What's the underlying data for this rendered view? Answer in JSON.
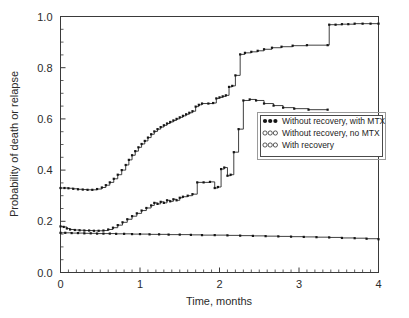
{
  "chart_data": {
    "type": "line",
    "title": "",
    "subtitle": "",
    "xlabel": "Time, months",
    "ylabel": "Probability of death or relapse",
    "xlim": [
      0,
      4
    ],
    "ylim": [
      0,
      1.0
    ],
    "grid": false,
    "legend_position": "center-right",
    "x_ticks": [
      "0",
      "1",
      "2",
      "3",
      "4"
    ],
    "x_tick_values": [
      0,
      1,
      2,
      3,
      4
    ],
    "x_minor_interval": 0.1,
    "y_ticks": [
      "0.0",
      "0.2",
      "0.4",
      "0.6",
      "0.8",
      "1.0"
    ],
    "y_tick_values": [
      0.0,
      0.2,
      0.4,
      0.6,
      0.8,
      1.0
    ],
    "y_minor_interval": 0.05,
    "marker_style": "step-curve-with-points",
    "line_color": "#2a2a2a",
    "marker_color": "#151515",
    "series": [
      {
        "name": "Without recovery, with MTX",
        "legend_marker": "filled",
        "points": [
          [
            0.0,
            0.33
          ],
          [
            0.05,
            0.33
          ],
          [
            0.1,
            0.329
          ],
          [
            0.16,
            0.327
          ],
          [
            0.22,
            0.325
          ],
          [
            0.28,
            0.324
          ],
          [
            0.34,
            0.323
          ],
          [
            0.4,
            0.323
          ],
          [
            0.46,
            0.326
          ],
          [
            0.52,
            0.332
          ],
          [
            0.57,
            0.341
          ],
          [
            0.62,
            0.352
          ],
          [
            0.67,
            0.366
          ],
          [
            0.72,
            0.382
          ],
          [
            0.77,
            0.4
          ],
          [
            0.82,
            0.42
          ],
          [
            0.86,
            0.44
          ],
          [
            0.9,
            0.458
          ],
          [
            0.94,
            0.474
          ],
          [
            0.98,
            0.489
          ],
          [
            1.02,
            0.502
          ],
          [
            1.06,
            0.514
          ],
          [
            1.1,
            0.527
          ],
          [
            1.14,
            0.54
          ],
          [
            1.18,
            0.551
          ],
          [
            1.22,
            0.56
          ],
          [
            1.26,
            0.568
          ],
          [
            1.3,
            0.575
          ],
          [
            1.34,
            0.582
          ],
          [
            1.38,
            0.588
          ],
          [
            1.42,
            0.594
          ],
          [
            1.46,
            0.6
          ],
          [
            1.5,
            0.606
          ],
          [
            1.54,
            0.612
          ],
          [
            1.58,
            0.618
          ],
          [
            1.62,
            0.624
          ],
          [
            1.66,
            0.63
          ],
          [
            1.7,
            0.648
          ],
          [
            1.74,
            0.655
          ],
          [
            1.78,
            0.66
          ],
          [
            1.86,
            0.66
          ],
          [
            1.92,
            0.662
          ],
          [
            1.96,
            0.68
          ],
          [
            2.0,
            0.684
          ],
          [
            2.04,
            0.688
          ],
          [
            2.08,
            0.692
          ],
          [
            2.12,
            0.725
          ],
          [
            2.16,
            0.729
          ],
          [
            2.2,
            0.77
          ],
          [
            2.26,
            0.852
          ],
          [
            2.32,
            0.858
          ],
          [
            2.4,
            0.862
          ],
          [
            2.48,
            0.866
          ],
          [
            2.56,
            0.872
          ],
          [
            2.66,
            0.878
          ],
          [
            2.78,
            0.882
          ],
          [
            2.92,
            0.886
          ],
          [
            3.1,
            0.888
          ],
          [
            3.36,
            0.888
          ],
          [
            3.38,
            0.968
          ],
          [
            3.46,
            0.968
          ],
          [
            3.54,
            0.97
          ],
          [
            3.62,
            0.97
          ],
          [
            3.7,
            0.972
          ],
          [
            3.8,
            0.972
          ],
          [
            3.9,
            0.972
          ],
          [
            4.0,
            0.972
          ]
        ]
      },
      {
        "name": "Without recovery, no MTX",
        "legend_marker": "open",
        "points": [
          [
            0.0,
            0.18
          ],
          [
            0.04,
            0.178
          ],
          [
            0.08,
            0.172
          ],
          [
            0.12,
            0.168
          ],
          [
            0.18,
            0.166
          ],
          [
            0.24,
            0.165
          ],
          [
            0.3,
            0.164
          ],
          [
            0.36,
            0.164
          ],
          [
            0.42,
            0.163
          ],
          [
            0.48,
            0.163
          ],
          [
            0.54,
            0.164
          ],
          [
            0.6,
            0.168
          ],
          [
            0.66,
            0.175
          ],
          [
            0.72,
            0.185
          ],
          [
            0.78,
            0.196
          ],
          [
            0.84,
            0.208
          ],
          [
            0.9,
            0.22
          ],
          [
            0.96,
            0.231
          ],
          [
            1.02,
            0.242
          ],
          [
            1.08,
            0.252
          ],
          [
            1.14,
            0.262
          ],
          [
            1.18,
            0.272
          ],
          [
            1.22,
            0.268
          ],
          [
            1.26,
            0.276
          ],
          [
            1.3,
            0.272
          ],
          [
            1.34,
            0.282
          ],
          [
            1.38,
            0.278
          ],
          [
            1.42,
            0.286
          ],
          [
            1.46,
            0.282
          ],
          [
            1.5,
            0.292
          ],
          [
            1.54,
            0.296
          ],
          [
            1.6,
            0.3
          ],
          [
            1.66,
            0.306
          ],
          [
            1.72,
            0.352
          ],
          [
            1.8,
            0.352
          ],
          [
            1.88,
            0.354
          ],
          [
            1.94,
            0.33
          ],
          [
            1.98,
            0.334
          ],
          [
            2.02,
            0.404
          ],
          [
            2.06,
            0.41
          ],
          [
            2.1,
            0.378
          ],
          [
            2.14,
            0.382
          ],
          [
            2.18,
            0.47
          ],
          [
            2.24,
            0.56
          ],
          [
            2.3,
            0.672
          ],
          [
            2.38,
            0.676
          ],
          [
            2.46,
            0.672
          ],
          [
            2.56,
            0.66
          ],
          [
            2.68,
            0.652
          ],
          [
            2.8,
            0.644
          ],
          [
            2.94,
            0.64
          ],
          [
            3.12,
            0.636
          ],
          [
            3.36,
            0.636
          ]
        ]
      },
      {
        "name": "With recovery",
        "legend_marker": "open-small",
        "points": [
          [
            0.0,
            0.155
          ],
          [
            0.06,
            0.155
          ],
          [
            0.14,
            0.154
          ],
          [
            0.22,
            0.154
          ],
          [
            0.3,
            0.153
          ],
          [
            0.38,
            0.153
          ],
          [
            0.46,
            0.152
          ],
          [
            0.54,
            0.152
          ],
          [
            0.62,
            0.152
          ],
          [
            0.7,
            0.151
          ],
          [
            0.8,
            0.151
          ],
          [
            0.9,
            0.15
          ],
          [
            1.0,
            0.15
          ],
          [
            1.12,
            0.149
          ],
          [
            1.24,
            0.149
          ],
          [
            1.36,
            0.148
          ],
          [
            1.5,
            0.148
          ],
          [
            1.64,
            0.147
          ],
          [
            1.78,
            0.146
          ],
          [
            1.94,
            0.146
          ],
          [
            2.1,
            0.145
          ],
          [
            2.26,
            0.144
          ],
          [
            2.42,
            0.143
          ],
          [
            2.58,
            0.142
          ],
          [
            2.74,
            0.141
          ],
          [
            2.9,
            0.14
          ],
          [
            3.06,
            0.139
          ],
          [
            3.22,
            0.138
          ],
          [
            3.38,
            0.137
          ],
          [
            3.54,
            0.135
          ],
          [
            3.7,
            0.134
          ],
          [
            3.85,
            0.132
          ],
          [
            4.0,
            0.13
          ]
        ]
      }
    ],
    "legend": [
      "Without recovery, with MTX",
      "Without recovery, no MTX",
      "With recovery"
    ]
  },
  "axes": {
    "x_title": "Time, months",
    "y_title": "Probability of death or relapse"
  }
}
